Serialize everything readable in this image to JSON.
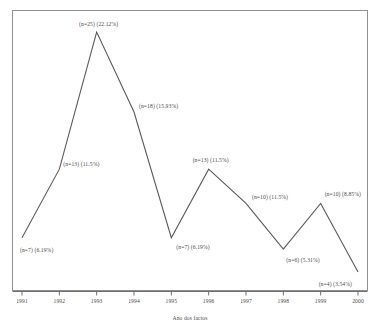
{
  "chart_data": {
    "type": "line",
    "title": "",
    "subtitle": "",
    "xlabel": "Ano dos factos",
    "ylabel": "",
    "grid": false,
    "legend": false,
    "categories": [
      "1991",
      "1992",
      "1993",
      "1994",
      "1995",
      "1996",
      "1997",
      "1998",
      "1999",
      "2000"
    ],
    "values": [
      7,
      13,
      25,
      18,
      7,
      13,
      10,
      6,
      10,
      4
    ],
    "percent_values": [
      6.19,
      11.5,
      22.12,
      15.93,
      6.19,
      11.5,
      11.5,
      5.31,
      8.85,
      3.54
    ],
    "point_labels": [
      "(n=7) (6.19%)",
      "(n=13) (11.5%)",
      "(n=25) (22.12%)",
      "(n=18) (15.93%)",
      "(n=7) (6.19%)",
      "(n=13) (11.5%)",
      "(n=10) (11.5%)",
      "(n=6) (5.31%)",
      "(n=10) (8.85%)",
      "(n=4) (3.54%)"
    ],
    "xlim": [
      1991,
      2000
    ],
    "ylim": [
      0,
      25
    ],
    "units": "casos"
  },
  "axis": {
    "x_ticks": [
      "1991",
      "1992",
      "1993",
      "1994",
      "1995",
      "1996",
      "1997",
      "1998",
      "1999",
      "2000"
    ],
    "x_title": "Ano dos factos"
  },
  "colors": {
    "line": "#5a5a5a",
    "frame": "#8f8f8f",
    "text": "#4a4a4a",
    "background": "#ffffff"
  }
}
